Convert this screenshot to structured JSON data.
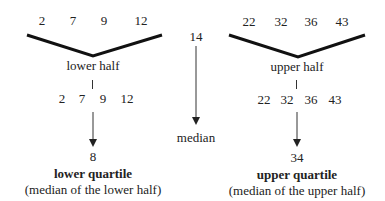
{
  "diagram": {
    "median": {
      "value": "14",
      "label": "median"
    },
    "lower": {
      "top_values": [
        "2",
        "7",
        "9",
        "12"
      ],
      "half_label": "lower half",
      "split_values": [
        "2",
        "7",
        "9",
        "12"
      ],
      "result": "8",
      "result_label": "lower quartile",
      "result_note": "(median of the lower half)"
    },
    "upper": {
      "top_values": [
        "22",
        "32",
        "36",
        "43"
      ],
      "half_label": "upper half",
      "split_values": [
        "22",
        "32",
        "36",
        "43"
      ],
      "result": "34",
      "result_label": "upper quartile",
      "result_note": "(median of the upper half)"
    },
    "colors": {
      "text": "#222222",
      "bracket": "#111111",
      "arrow": "#333333",
      "background": "#ffffff"
    }
  }
}
